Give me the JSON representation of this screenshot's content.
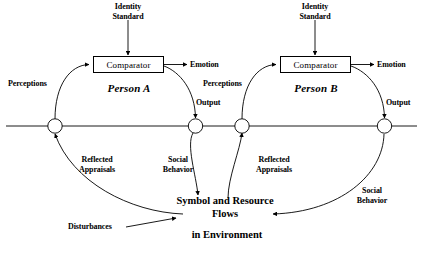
{
  "diagram": {
    "background_color": "#ffffff",
    "line_color": "#000000",
    "persons": [
      {
        "id": "person-a",
        "name": "Person A",
        "comparator_label": "Comparator",
        "identity_standard_label": "Identity\nStandard",
        "emotion_label": "Emotion",
        "perceptions_label": "Perceptions",
        "output_label": "Output",
        "reflected_appraisals_label": "Reflected\nAppraisals",
        "social_behavior_label": "Social\nBehavior"
      },
      {
        "id": "person-b",
        "name": "Person B",
        "comparator_label": "Comparator",
        "identity_standard_label": "Identity\nStandard",
        "emotion_label": "Emotion",
        "perceptions_label": "Perceptions",
        "output_label": "Output",
        "reflected_appraisals_label": "Reflected\nAppraisals",
        "social_behavior_label": "Social\nBehavior"
      }
    ],
    "environment": {
      "line1": "Symbol and Resource",
      "line2": "Flows",
      "line3": "in Environment",
      "disturbances_label": "Disturbances"
    }
  }
}
